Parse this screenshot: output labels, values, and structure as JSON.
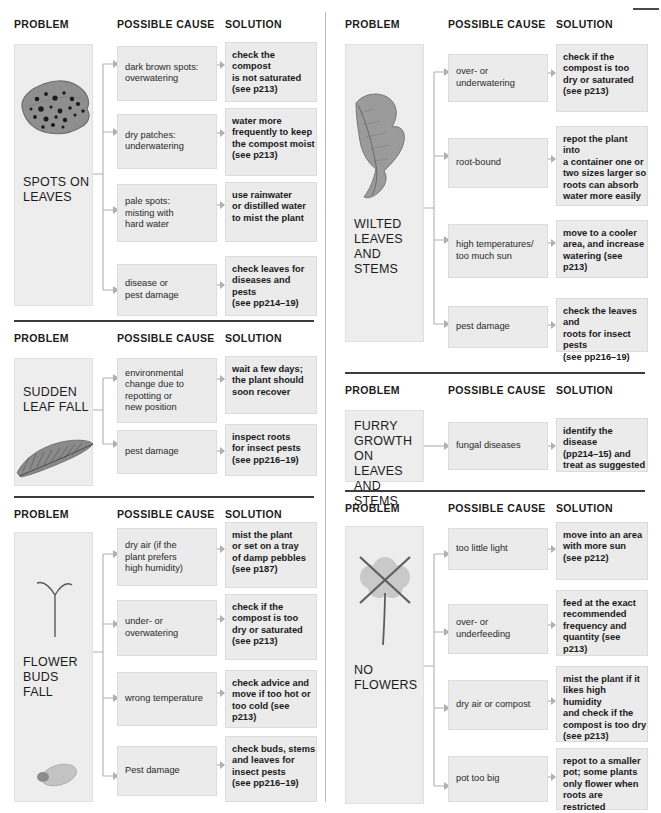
{
  "document": {
    "title": "Plant Problems Troubleshooting Chart",
    "headers": {
      "problem": "PROBLEM",
      "cause": "POSSIBLE CAUSE",
      "solution": "SOLUTION"
    },
    "colors": {
      "box_fill": "#ebebeb",
      "problem_fill": "#ededed",
      "box_border": "#dcdcdc",
      "rule": "#3b3b3b",
      "text": "#231f20",
      "art": "#9a9a9a"
    }
  },
  "sections": [
    {
      "id": "spots-on-leaves",
      "column": "left",
      "problem": "SPOTS ON\nLEAVES",
      "icon": "spotted-leaf-icon",
      "rows": [
        {
          "cause": "dark brown spots:\noverwatering",
          "solution": "check the compost\nis not saturated\n(see p213)"
        },
        {
          "cause": "dry patches:\nunderwatering",
          "solution": "water more\nfrequently to keep\nthe compost moist\n(see p213)"
        },
        {
          "cause": "pale spots:\nmisting with\nhard water",
          "solution": "use rainwater\nor distilled water\nto mist the plant"
        },
        {
          "cause": "disease or\npest damage",
          "solution": "check leaves for\ndiseases and pests\n(see pp214–19)"
        }
      ]
    },
    {
      "id": "sudden-leaf-fall",
      "column": "left",
      "problem": "SUDDEN\nLEAF FALL",
      "icon": "fallen-leaf-icon",
      "rows": [
        {
          "cause": "environmental\nchange due to\nrepotting or\nnew position",
          "solution": "wait a few days;\nthe plant should\nsoon recover"
        },
        {
          "cause": "pest damage",
          "solution": "inspect roots\nfor insect pests\n(see pp216–19)"
        }
      ]
    },
    {
      "id": "flower-buds-fall",
      "column": "left",
      "problem": "FLOWER\nBUDS FALL",
      "icon": "drooping-bud-icon",
      "rows": [
        {
          "cause": "dry air (if the\nplant prefers\nhigh humidity)",
          "solution": "mist the plant\nor set on a tray\nof damp pebbles\n(see p187)"
        },
        {
          "cause": "under- or\noverwatering",
          "solution": "check if the\ncompost is too\ndry or saturated\n(see p213)"
        },
        {
          "cause": "wrong temperature",
          "solution": "check advice and\nmove if too hot or\ntoo cold (see p213)"
        },
        {
          "cause": "Pest damage",
          "solution": "check buds, stems\nand leaves for\ninsect pests\n(see pp216–19)"
        }
      ]
    },
    {
      "id": "wilted-leaves-and-stems",
      "column": "right",
      "problem": "WILTED\nLEAVES\nAND\nSTEMS",
      "icon": "wilted-leaf-icon",
      "rows": [
        {
          "cause": "over- or\nunderwatering",
          "solution": "check if the\ncompost is too\ndry or saturated\n(see p213)"
        },
        {
          "cause": "root-bound",
          "solution": "repot the plant into\na container one or\ntwo sizes larger so\nroots can absorb\nwater more easily"
        },
        {
          "cause": "high temperatures/\ntoo much sun",
          "solution": "move to a cooler\narea, and increase\nwatering (see p213)"
        },
        {
          "cause": "pest damage",
          "solution": "check the leaves and\nroots for insect pests\n(see pp216–19)"
        }
      ]
    },
    {
      "id": "furry-growth-on-leaves-and-stems",
      "column": "right",
      "problem": "FURRY\nGROWTH\nON LEAVES\nAND STEMS",
      "icon": "none",
      "rows": [
        {
          "cause": "fungal diseases",
          "solution": "identify the disease\n(pp214–15) and\ntreat as suggested"
        }
      ]
    },
    {
      "id": "no-flowers",
      "column": "right",
      "problem": "NO\nFLOWERS",
      "icon": "crossed-out-flower-icon",
      "rows": [
        {
          "cause": "too little light",
          "solution": "move into an area\nwith more sun\n(see p212)"
        },
        {
          "cause": "over- or\nunderfeeding",
          "solution": "feed at the exact\nrecommended\nfrequency and\nquantity (see p213)"
        },
        {
          "cause": "dry air or compost",
          "solution": "mist the plant if it\nlikes high humidity\nand check if the\ncompost is too dry\n(see p213)"
        },
        {
          "cause": "pot too big",
          "solution": "repot to a smaller\npot; some plants\nonly flower when\nroots are restricted"
        }
      ]
    }
  ]
}
